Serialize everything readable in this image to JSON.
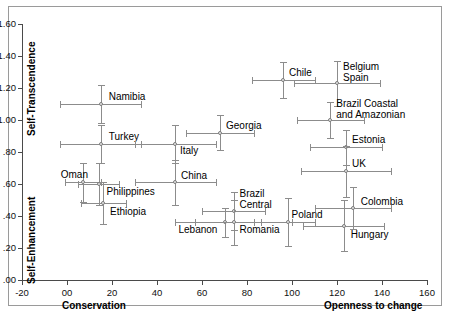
{
  "chart_data": {
    "type": "scatter",
    "title": "",
    "xlabel_left": "Conservation",
    "xlabel_right": "Openness to change",
    "ylabel_top": "Self-Transcendence",
    "ylabel_bottom": "Self-Enhancement",
    "xlim": [
      -20,
      160
    ],
    "ylim": [
      0.0,
      1.6
    ],
    "xticks": [
      -20,
      0,
      20,
      40,
      60,
      80,
      100,
      120,
      140,
      160
    ],
    "xtick_labels": [
      "-20",
      "00",
      "20",
      "40",
      "60",
      "80",
      "100",
      "120",
      "140",
      "160"
    ],
    "yticks": [
      0.0,
      0.2,
      0.4,
      0.6,
      0.8,
      1.0,
      1.2,
      1.4,
      1.6
    ],
    "ytick_labels": [
      ".00",
      ".20",
      ".40",
      ".60",
      ".80",
      "1.00",
      "1.20",
      "1.40",
      "1.60"
    ],
    "grid": false,
    "legend": "none",
    "error_bars": "both",
    "points": [
      {
        "label": "Namibia",
        "x": 15,
        "y": 1.1,
        "xerr_low": 18,
        "xerr_high": 18,
        "yerr_low": 0.12,
        "yerr_high": 0.12,
        "label_dx": 8,
        "label_dy": -13
      },
      {
        "label": "Turkey",
        "x": 15,
        "y": 0.85,
        "xerr_low": 18,
        "xerr_high": 18,
        "yerr_low": 0.12,
        "yerr_high": 0.12,
        "label_dx": 8,
        "label_dy": -13
      },
      {
        "label": "Oman",
        "x": 7,
        "y": 0.61,
        "xerr_low": 8,
        "xerr_high": 8,
        "yerr_low": 0.12,
        "yerr_high": 0.12,
        "label_dx": -22,
        "label_dy": -13
      },
      {
        "label": "Philippines",
        "x": 14,
        "y": 0.6,
        "xerr_low": 9,
        "xerr_high": 9,
        "yerr_low": 0.13,
        "yerr_high": 0.13,
        "label_dx": 8,
        "label_dy": 2
      },
      {
        "label": "Ethiopia",
        "x": 16,
        "y": 0.48,
        "xerr_low": 10,
        "xerr_high": 10,
        "yerr_low": 0.13,
        "yerr_high": 0.13,
        "label_dx": 7,
        "label_dy": 3
      },
      {
        "label": "Italy",
        "x": 48,
        "y": 0.85,
        "xerr_low": 18,
        "xerr_high": 18,
        "yerr_low": 0.12,
        "yerr_high": 0.12,
        "label_dx": 5,
        "label_dy": 1
      },
      {
        "label": "Georgia",
        "x": 68,
        "y": 0.92,
        "xerr_low": 15,
        "xerr_high": 15,
        "yerr_low": 0.11,
        "yerr_high": 0.11,
        "label_dx": 6,
        "label_dy": -13
      },
      {
        "label": "China",
        "x": 48,
        "y": 0.61,
        "xerr_low": 18,
        "xerr_high": 18,
        "yerr_low": 0.14,
        "yerr_high": 0.14,
        "label_dx": 6,
        "label_dy": -12
      },
      {
        "label": "Brazil\nCentral",
        "x": 74,
        "y": 0.43,
        "xerr_low": 14,
        "xerr_high": 14,
        "yerr_low": 0.12,
        "yerr_high": 0.12,
        "label_dx": 6,
        "label_dy": -23
      },
      {
        "label": "Lebanon",
        "x": 70,
        "y": 0.36,
        "xerr_low": 13,
        "xerr_high": 13,
        "yerr_low": 0.09,
        "yerr_high": 0.09,
        "label_dx": -46,
        "label_dy": 2
      },
      {
        "label": "Romania",
        "x": 74,
        "y": 0.36,
        "xerr_low": 26,
        "xerr_high": 26,
        "yerr_low": 0.14,
        "yerr_high": 0.14,
        "label_dx": 6,
        "label_dy": 2
      },
      {
        "label": "Chile",
        "x": 96,
        "y": 1.25,
        "xerr_low": 14,
        "xerr_high": 14,
        "yerr_low": 0.11,
        "yerr_high": 0.11,
        "label_dx": 6,
        "label_dy": -13
      },
      {
        "label": "Belgium\nSpain",
        "x": 120,
        "y": 1.23,
        "xerr_low": 19,
        "xerr_high": 19,
        "yerr_low": 0.14,
        "yerr_high": 0.14,
        "label_dx": 6,
        "label_dy": -22
      },
      {
        "label": "Brazil Coastal\nand Amazonian",
        "x": 117,
        "y": 1.0,
        "xerr_low": 15,
        "xerr_high": 15,
        "yerr_low": 0.11,
        "yerr_high": 0.11,
        "label_dx": 6,
        "label_dy": -22
      },
      {
        "label": "Estonia",
        "x": 124,
        "y": 0.83,
        "xerr_low": 16,
        "xerr_high": 16,
        "yerr_low": 0.11,
        "yerr_high": 0.11,
        "label_dx": 6,
        "label_dy": -13
      },
      {
        "label": "UK",
        "x": 124,
        "y": 0.68,
        "xerr_low": 20,
        "xerr_high": 20,
        "yerr_low": 0.16,
        "yerr_high": 0.16,
        "label_dx": 6,
        "label_dy": -13
      },
      {
        "label": "Poland",
        "x": 98,
        "y": 0.36,
        "xerr_low": 12,
        "xerr_high": 12,
        "yerr_low": 0.15,
        "yerr_high": 0.15,
        "label_dx": 4,
        "label_dy": -13
      },
      {
        "label": "Colombia",
        "x": 127,
        "y": 0.45,
        "xerr_low": 17,
        "xerr_high": 17,
        "yerr_low": 0.13,
        "yerr_high": 0.13,
        "label_dx": 8,
        "label_dy": -12
      },
      {
        "label": "Hungary",
        "x": 123,
        "y": 0.34,
        "xerr_low": 18,
        "xerr_high": 18,
        "yerr_low": 0.16,
        "yerr_high": 0.16,
        "label_dx": 7,
        "label_dy": 3
      }
    ]
  }
}
